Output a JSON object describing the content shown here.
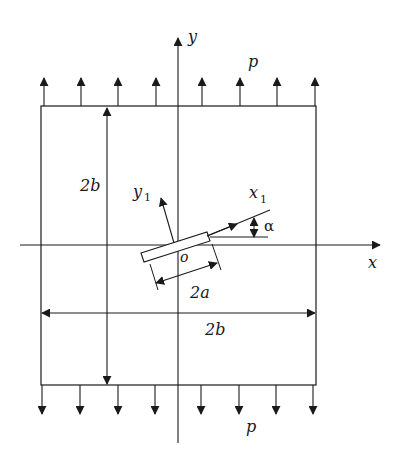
{
  "figure": {
    "labels": {
      "y_axis": "y",
      "x_axis": "x",
      "load_top": "p",
      "load_bottom": "p",
      "height_dim": "2b",
      "width_dim": "2b",
      "crack_len": "2a",
      "origin": "o",
      "local_x": "x",
      "local_x_sub": "1",
      "local_y": "y",
      "local_y_sub": "1",
      "angle": "α"
    },
    "colors": {
      "stroke": "#1a1a1a",
      "background": "#ffffff"
    },
    "load_arrows_top_x": [
      44,
      81,
      118,
      156,
      202,
      240,
      277,
      315
    ],
    "load_arrows_bottom_x": [
      42,
      80,
      118,
      155,
      201,
      239,
      276,
      313
    ]
  }
}
